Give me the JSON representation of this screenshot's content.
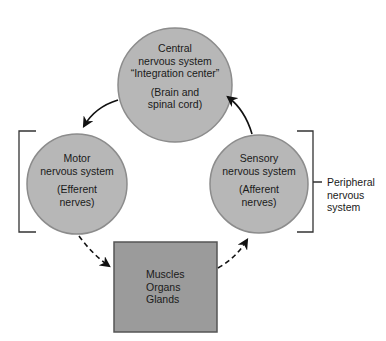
{
  "colors": {
    "circle_fill": "#b7b7b7",
    "circle_stroke": "#8c8c8c",
    "box_fill": "#9b9b9b",
    "box_stroke": "#555555",
    "arrow": "#111111",
    "bracket": "#333333"
  },
  "nodes": {
    "central": {
      "line1": "Central",
      "line2": "nervous system",
      "line3": "“Integration center”",
      "line4": "(Brain and",
      "line5": "spinal cord)"
    },
    "motor": {
      "line1": "Motor",
      "line2": "nervous system",
      "line3": "(Efferent",
      "line4": "nerves)"
    },
    "sensory": {
      "line1": "Sensory",
      "line2": "nervous system",
      "line3": "(Afferent",
      "line4": "nerves)"
    },
    "effectors": {
      "line1": "Muscles",
      "line2": "Organs",
      "line3": "Glands"
    }
  },
  "peripheral_label": {
    "line1": "Peripheral",
    "line2": "nervous",
    "line3": "system"
  },
  "edges": [
    {
      "from": "central",
      "to": "motor",
      "style": "solid"
    },
    {
      "from": "sensory",
      "to": "central",
      "style": "solid"
    },
    {
      "from": "motor",
      "to": "effectors",
      "style": "dashed"
    },
    {
      "from": "effectors",
      "to": "sensory",
      "style": "dashed"
    }
  ]
}
